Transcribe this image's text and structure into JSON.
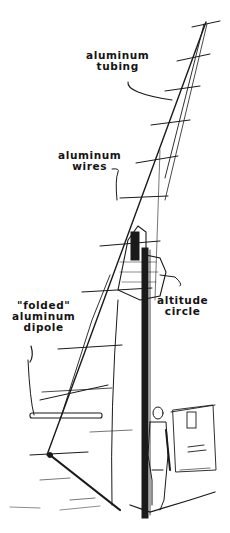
{
  "illustration": {
    "subject": "yagi-antenna-on-pole",
    "labels": {
      "tubing_line1": "aluminum",
      "tubing_line2": "tubing",
      "wires_line1": "aluminum",
      "wires_line2": "wires",
      "dipole_line1": "\"folded\"",
      "dipole_line2": "aluminum",
      "dipole_line3": "dipole",
      "circle_line1": "altitude",
      "circle_line2": "circle"
    },
    "signature": "Sgwar... sketch"
  },
  "colors": {
    "ink": "#141414",
    "paper": "#ffffff"
  }
}
